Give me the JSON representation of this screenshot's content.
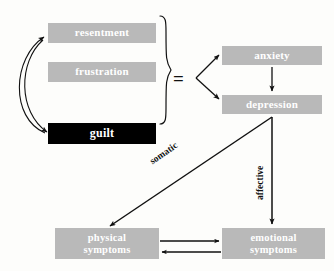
{
  "diagram": {
    "background_color": "#fdfdfb",
    "node_fill": "#b9b9b9",
    "node_highlight_fill": "#000000",
    "node_text_color": "#ffffff",
    "stroke_color": "#111111",
    "operator": "=",
    "nodes": {
      "resentment": "resentment",
      "frustration": "frustration",
      "guilt": "guilt",
      "anxiety": "anxiety",
      "depression": "depression",
      "physical_line1": "physical",
      "physical_line2": "symptoms",
      "emotional_line1": "emotional",
      "emotional_line2": "symptoms"
    },
    "edge_labels": {
      "somatic": "somatic",
      "affective": "affective"
    }
  }
}
